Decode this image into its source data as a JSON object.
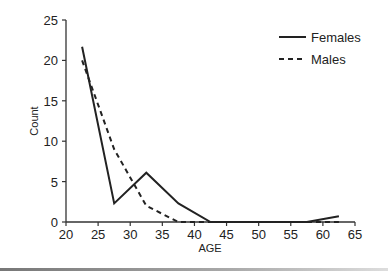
{
  "chart_data": {
    "type": "line",
    "title": "",
    "xlabel": "AGE",
    "ylabel": "Count",
    "xlim": [
      20,
      65
    ],
    "ylim": [
      0,
      25
    ],
    "x_ticks": [
      20,
      25,
      30,
      35,
      40,
      45,
      50,
      55,
      60,
      65
    ],
    "y_ticks": [
      0,
      5,
      10,
      15,
      20,
      25
    ],
    "grid": false,
    "legend_position": "upper right",
    "series": [
      {
        "name": "Females",
        "style": "solid",
        "x": [
          22.5,
          27.5,
          32.5,
          37.5,
          42.5,
          47.5,
          52.5,
          57.5,
          62.5
        ],
        "values": [
          21.7,
          2.3,
          6.1,
          2.3,
          0,
          0,
          0,
          0,
          0.7
        ]
      },
      {
        "name": "Males",
        "style": "dashed",
        "x": [
          22.5,
          27.5,
          32.5,
          37.5,
          42.5,
          47.5,
          52.5,
          57.5,
          62.5
        ],
        "values": [
          20,
          9,
          2,
          0,
          0,
          0,
          0,
          0,
          0
        ]
      }
    ]
  },
  "legend": {
    "females": "Females",
    "males": "Males"
  },
  "axes": {
    "xlabel": "AGE",
    "ylabel": "Count"
  }
}
